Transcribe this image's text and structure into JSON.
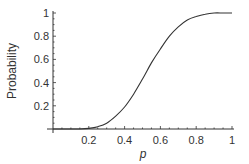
{
  "chart_data": {
    "type": "line",
    "title": "",
    "xlabel": "p",
    "ylabel": "Probability",
    "xlim": [
      0,
      1
    ],
    "ylim": [
      0,
      1
    ],
    "grid": false,
    "legend": null,
    "x_ticks": [
      "0.2",
      "0.4",
      "0.6",
      "0.8",
      "1"
    ],
    "y_ticks": [
      "0.2",
      "0.4",
      "0.6",
      "0.8",
      "1"
    ],
    "series": [
      {
        "name": "Probability",
        "x": [
          0.0,
          0.1,
          0.15,
          0.2,
          0.25,
          0.3,
          0.35,
          0.4,
          0.45,
          0.5,
          0.55,
          0.6,
          0.65,
          0.7,
          0.75,
          0.8,
          0.85,
          0.9,
          0.95,
          1.0
        ],
        "values": [
          0.0,
          0.0,
          0.0,
          0.005,
          0.02,
          0.05,
          0.11,
          0.19,
          0.3,
          0.43,
          0.57,
          0.69,
          0.8,
          0.88,
          0.94,
          0.97,
          0.99,
          1.0,
          1.0,
          1.0
        ]
      }
    ]
  },
  "axis": {
    "x_label": "p",
    "y_label": "Probability"
  },
  "colors": {
    "axis": "#333333",
    "curve": "#333333",
    "background": "#ffffff"
  }
}
